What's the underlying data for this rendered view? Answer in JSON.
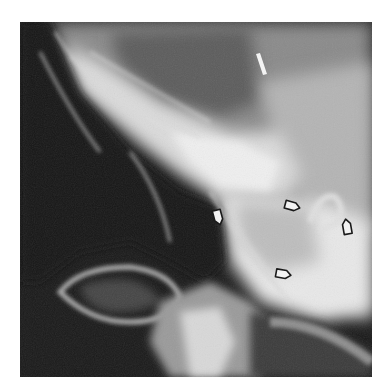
{
  "image": {
    "kind": "radiograph",
    "description": "Lateral skull/neck X-ray with open arrow annotations",
    "palette": {
      "background": "#ffffff",
      "dark": "#141414",
      "mid": "#6e6e6e",
      "light": "#e6e6e6",
      "arrow_stroke": "#1a1a1a",
      "arrow_fill": "#f2f2f2"
    },
    "annotations": [
      {
        "type": "open-arrow",
        "pointing": "right"
      },
      {
        "type": "open-arrow",
        "pointing": "right"
      },
      {
        "type": "open-arrow",
        "pointing": "left"
      },
      {
        "type": "open-arrow",
        "pointing": "right"
      }
    ]
  }
}
